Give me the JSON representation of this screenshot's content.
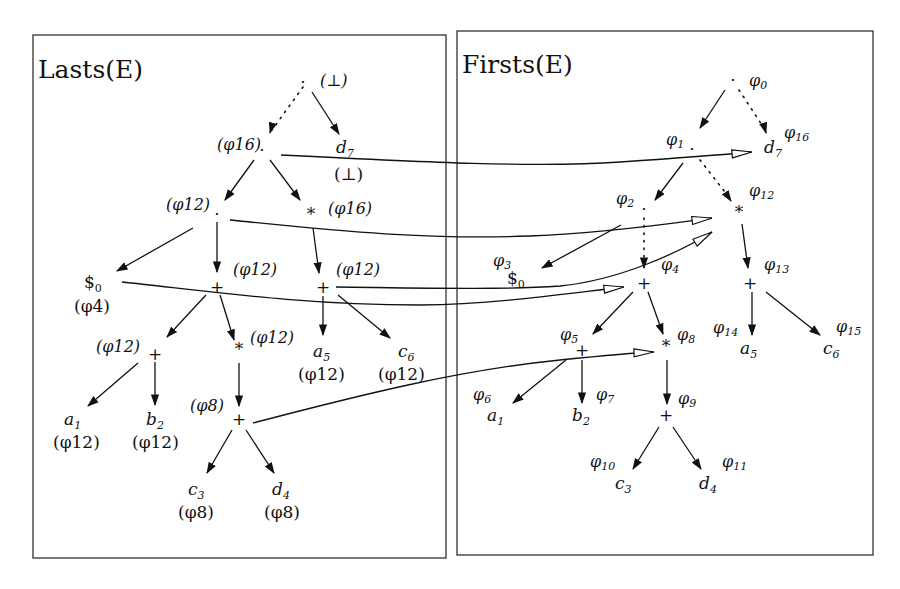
{
  "panels": [
    {
      "id": "lasts",
      "title": "Lasts(E)"
    },
    {
      "id": "firsts",
      "title": "Firsts(E)"
    }
  ],
  "lasts_tree": {
    "root": {
      "symbol": "·",
      "annotation": "(⊥)"
    },
    "concat1": {
      "symbol": "·",
      "annotation": "(φ16)"
    },
    "d7": {
      "label": "d",
      "sub": "7",
      "annotation": "(⊥)"
    },
    "concat2": {
      "symbol": "·",
      "annotation": "(φ12)"
    },
    "star1": {
      "symbol": "*",
      "annotation": "(φ16)"
    },
    "dollar0": {
      "label": "$",
      "sub": "0",
      "annotation": "(φ4)"
    },
    "plus1": {
      "symbol": "+",
      "annotation": "(φ12)"
    },
    "plus2": {
      "symbol": "+",
      "annotation": "(φ12)"
    },
    "plus3": {
      "symbol": "+",
      "annotation": "(φ12)"
    },
    "star2": {
      "symbol": "*",
      "annotation": "(φ12)"
    },
    "a5": {
      "label": "a",
      "sub": "5",
      "annotation": "(φ12)"
    },
    "c6": {
      "label": "c",
      "sub": "6",
      "annotation": "(φ12)"
    },
    "a1": {
      "label": "a",
      "sub": "1",
      "annotation": "(φ12)"
    },
    "b2": {
      "label": "b",
      "sub": "2",
      "annotation": "(φ12)"
    },
    "plus4": {
      "symbol": "+",
      "annotation": "(φ8)"
    },
    "c3": {
      "label": "c",
      "sub": "3",
      "annotation": "(φ8)"
    },
    "d4": {
      "label": "d",
      "sub": "4",
      "annotation": "(φ8)"
    }
  },
  "firsts_tree": {
    "phi0": {
      "symbol": "·",
      "annotation": "φ",
      "sub": "0"
    },
    "phi1": {
      "symbol": "·",
      "annotation": "φ",
      "sub": "1"
    },
    "d7": {
      "label": "d",
      "sub": "7",
      "annotation": "φ",
      "asub": "16"
    },
    "phi2": {
      "symbol": "·",
      "annotation": "φ",
      "sub": "2"
    },
    "phi12": {
      "symbol": "*",
      "annotation": "φ",
      "sub": "12"
    },
    "dollar0": {
      "label": "$",
      "sub": "0",
      "annotation": "φ",
      "asub": "3"
    },
    "phi4": {
      "symbol": "+",
      "annotation": "φ",
      "sub": "4"
    },
    "phi13": {
      "symbol": "+",
      "annotation": "φ",
      "sub": "13"
    },
    "phi5": {
      "symbol": "+",
      "annotation": "φ",
      "sub": "5"
    },
    "phi8": {
      "symbol": "*",
      "annotation": "φ",
      "sub": "8"
    },
    "a5": {
      "label": "a",
      "sub": "5",
      "annotation": "φ",
      "asub": "14"
    },
    "c6": {
      "label": "c",
      "sub": "6",
      "annotation": "φ",
      "asub": "15"
    },
    "a1": {
      "label": "a",
      "sub": "1",
      "annotation": "φ",
      "asub": "6"
    },
    "b2": {
      "label": "b",
      "sub": "2",
      "annotation": "φ",
      "asub": "7"
    },
    "phi9": {
      "symbol": "+",
      "annotation": "φ",
      "sub": "9"
    },
    "c3": {
      "label": "c",
      "sub": "3",
      "annotation": "φ",
      "asub": "10"
    },
    "d4": {
      "label": "d",
      "sub": "4",
      "annotation": "φ",
      "asub": "11"
    }
  },
  "links": [
    {
      "from": "lasts.concat1 (φ16)",
      "to": "firsts.d7 (φ16)"
    },
    {
      "from": "lasts.concat2 (φ12)",
      "to": "firsts.phi12 (*)"
    },
    {
      "from": "lasts.plus3 (φ12)",
      "to": "firsts.phi12 (*)"
    },
    {
      "from": "lasts.dollar0 (φ4)",
      "to": "firsts.phi4 (+)"
    },
    {
      "from": "lasts.plus4 (φ8)",
      "to": "firsts.phi8 (*)"
    }
  ]
}
